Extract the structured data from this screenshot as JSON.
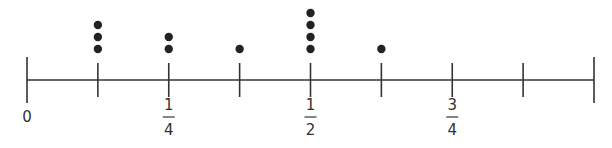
{
  "chart_data": {
    "type": "dot_plot",
    "title": "",
    "xlabel": "",
    "ylabel": "",
    "xlim": [
      0,
      1
    ],
    "tick_step": 0.125,
    "tick_values": [
      0,
      0.125,
      0.25,
      0.375,
      0.5,
      0.625,
      0.75,
      0.875,
      1
    ],
    "tick_labels": [
      {
        "value": 0,
        "text": "0"
      },
      {
        "value": 0.25,
        "numerator": "1",
        "denominator": "4"
      },
      {
        "value": 0.5,
        "numerator": "1",
        "denominator": "2"
      },
      {
        "value": 0.75,
        "numerator": "3",
        "denominator": "4"
      }
    ],
    "x": [
      0.125,
      0.25,
      0.375,
      0.5,
      0.625
    ],
    "x_fraction_labels": [
      "1/8",
      "1/4",
      "3/8",
      "1/2",
      "5/8"
    ],
    "counts": [
      3,
      2,
      1,
      4,
      1
    ],
    "grid": false
  },
  "style": {
    "line_color": "#333333",
    "dot_color": "#222222"
  }
}
